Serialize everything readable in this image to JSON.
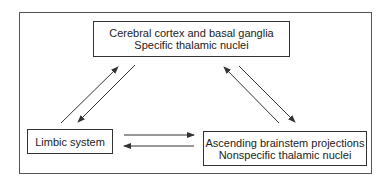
{
  "diagram": {
    "nodes": {
      "top": {
        "line1": "Cerebral cortex and basal ganglia",
        "line2": "Specific thalamic nuclei"
      },
      "left": {
        "line1": "Limbic system"
      },
      "right": {
        "line1": "Ascending brainstem projections",
        "line2": "Nonspecific thalamic nuclei"
      }
    },
    "edges": [
      {
        "from": "left",
        "to": "top"
      },
      {
        "from": "top",
        "to": "left"
      },
      {
        "from": "right",
        "to": "top"
      },
      {
        "from": "top",
        "to": "right"
      },
      {
        "from": "left",
        "to": "right"
      },
      {
        "from": "right",
        "to": "left"
      }
    ],
    "colors": {
      "line": "#333333",
      "background": "#ffffff"
    }
  }
}
